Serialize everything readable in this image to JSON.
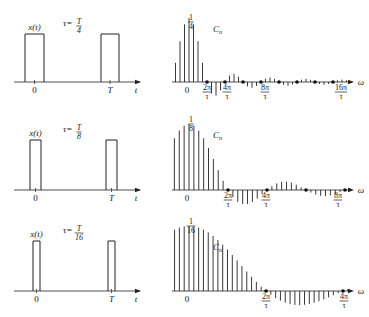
{
  "panels": [
    {
      "id": "quarter",
      "signal_label": "x(t)",
      "tau_label": "τ=",
      "tau_num": "T",
      "tau_den": "4",
      "time_axis": {
        "zero": "0",
        "period": "T",
        "var": "t"
      },
      "spectrum_label": "C",
      "spectrum_sub": "n",
      "peak_num": "1",
      "peak_den": "4",
      "freq_var": "ω",
      "freq_ticks": [
        {
          "num": "2π",
          "den": "τ"
        },
        {
          "num": "4π",
          "den": "τ"
        },
        {
          "num": "8π",
          "den": "τ"
        },
        {
          "num": "16π",
          "den": "τ"
        }
      ],
      "duty": 0.25
    },
    {
      "id": "eighth",
      "signal_label": "x(t)",
      "tau_label": "τ=",
      "tau_num": "T",
      "tau_den": "8",
      "time_axis": {
        "zero": "0",
        "period": "T",
        "var": "t"
      },
      "spectrum_label": "C",
      "spectrum_sub": "n",
      "peak_num": "1",
      "peak_den": "8",
      "freq_var": "ω",
      "freq_ticks": [
        {
          "num": "2π",
          "den": "τ"
        },
        {
          "num": "4π",
          "den": "τ"
        },
        {
          "num": "8π",
          "den": "τ"
        }
      ],
      "duty": 0.125
    },
    {
      "id": "sixteenth",
      "signal_label": "x(t)",
      "tau_label": "τ=",
      "tau_num": "T",
      "tau_den": "16",
      "time_axis": {
        "zero": "0",
        "period": "T",
        "var": "t"
      },
      "spectrum_label": "C",
      "spectrum_sub": "n",
      "peak_num": "1",
      "peak_den": "16",
      "freq_var": "ω",
      "freq_ticks": [
        {
          "num": "2π",
          "den": "τ"
        },
        {
          "num": "4π",
          "den": "τ"
        }
      ],
      "duty": 0.0625
    }
  ]
}
